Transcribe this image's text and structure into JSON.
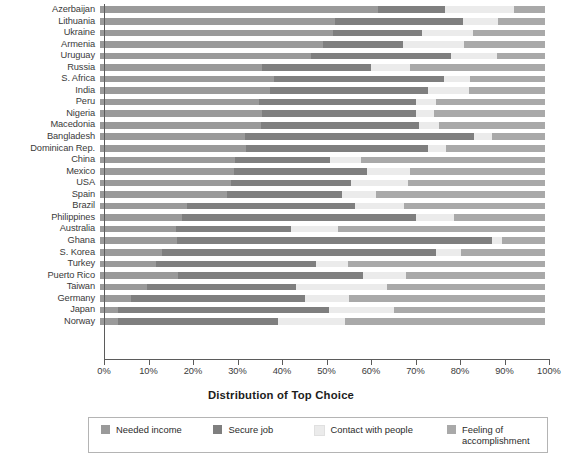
{
  "chart_data": {
    "type": "bar",
    "subtype": "stacked-horizontal-100",
    "title": "",
    "xlabel": "Distribution of Top Choice",
    "ylabel": "",
    "xlim": [
      0,
      100
    ],
    "xticks": [
      "0%",
      "10%",
      "20%",
      "30%",
      "40%",
      "50%",
      "60%",
      "70%",
      "80%",
      "90%",
      "100%"
    ],
    "grid": false,
    "legend_position": "bottom",
    "series": [
      {
        "name": "Needed income",
        "color": "#9a9a9a"
      },
      {
        "name": "Secure job",
        "color": "#7f7f7f"
      },
      {
        "name": "Contact with people",
        "color": "#ebebeb"
      },
      {
        "name": "Feeling of accomplishment",
        "color": "#a9a9a9"
      }
    ],
    "categories": [
      "Azerbaijan",
      "Lithuania",
      "Ukraine",
      "Armenia",
      "Uruguay",
      "Russia",
      "S. Africa",
      "India",
      "Peru",
      "Nigeria",
      "Macedonia",
      "Bangladesh",
      "Dominican Rep.",
      "China",
      "Mexico",
      "USA",
      "Spain",
      "Brazil",
      "Philippines",
      "Australia",
      "Ghana",
      "S. Korea",
      "Turkey",
      "Puerto Rico",
      "Taiwan",
      "Germany",
      "Japan",
      "Norway"
    ],
    "rows": [
      {
        "country": "Azerbaijan",
        "values": [
          62.4,
          15.1,
          15.5,
          7.0
        ]
      },
      {
        "country": "Lithuania",
        "values": [
          52.7,
          28.8,
          8.0,
          10.5
        ]
      },
      {
        "country": "Ukraine",
        "values": [
          52.3,
          20.0,
          11.6,
          16.1
        ]
      },
      {
        "country": "Armenia",
        "values": [
          50.2,
          18.0,
          13.7,
          18.1
        ]
      },
      {
        "country": "Uruguay",
        "values": [
          47.5,
          31.4,
          10.4,
          10.7
        ]
      },
      {
        "country": "Russia",
        "values": [
          36.5,
          24.3,
          8.9,
          30.3
        ]
      },
      {
        "country": "S. Africa",
        "values": [
          39.2,
          38.0,
          6.0,
          16.8
        ]
      },
      {
        "country": "India",
        "values": [
          38.2,
          35.4,
          9.4,
          17.0
        ]
      },
      {
        "country": "Peru",
        "values": [
          35.8,
          35.2,
          4.5,
          24.5
        ]
      },
      {
        "country": "Nigeria",
        "values": [
          36.5,
          34.5,
          4.1,
          24.9
        ]
      },
      {
        "country": "Macedonia",
        "values": [
          36.2,
          35.5,
          4.5,
          23.8
        ]
      },
      {
        "country": "Bangladesh",
        "values": [
          32.5,
          51.5,
          4.2,
          11.8
        ]
      },
      {
        "country": "Dominican Rep.",
        "values": [
          32.9,
          40.7,
          4.1,
          22.3
        ]
      },
      {
        "country": "China",
        "values": [
          30.3,
          21.4,
          7.0,
          41.3
        ]
      },
      {
        "country": "Mexico",
        "values": [
          30.0,
          30.0,
          9.6,
          30.4
        ]
      },
      {
        "country": "USA",
        "values": [
          29.5,
          27.0,
          12.8,
          30.7
        ]
      },
      {
        "country": "Spain",
        "values": [
          28.5,
          25.9,
          7.6,
          38.0
        ]
      },
      {
        "country": "Brazil",
        "values": [
          19.5,
          37.8,
          11.1,
          31.6
        ]
      },
      {
        "country": "Philippines",
        "values": [
          18.5,
          52.5,
          8.5,
          20.5
        ]
      },
      {
        "country": "Australia",
        "values": [
          17.0,
          26.0,
          10.5,
          46.5
        ]
      },
      {
        "country": "Ghana",
        "values": [
          17.2,
          71.0,
          2.1,
          9.7
        ]
      },
      {
        "country": "S. Korea",
        "values": [
          14.0,
          61.5,
          5.7,
          18.8
        ]
      },
      {
        "country": "Turkey",
        "values": [
          12.6,
          36.0,
          7.2,
          44.2
        ]
      },
      {
        "country": "Puerto Rico",
        "values": [
          17.5,
          41.5,
          9.8,
          31.2
        ]
      },
      {
        "country": "Taiwan",
        "values": [
          10.5,
          33.5,
          20.5,
          35.5
        ]
      },
      {
        "country": "Germany",
        "values": [
          7.0,
          39.0,
          10.0,
          44.0
        ]
      },
      {
        "country": "Japan",
        "values": [
          4.0,
          47.5,
          14.5,
          34.0
        ]
      },
      {
        "country": "Norway",
        "values": [
          4.0,
          36.0,
          15.0,
          45.0
        ]
      }
    ]
  },
  "axis": {
    "xlabel": "Distribution of Top Choice",
    "ticks": [
      "0%",
      "10%",
      "20%",
      "30%",
      "40%",
      "50%",
      "60%",
      "70%",
      "80%",
      "90%",
      "100%"
    ]
  },
  "legend": {
    "items": [
      {
        "label": "Needed income",
        "color": "#9a9a9a"
      },
      {
        "label": "Secure job",
        "color": "#7f7f7f"
      },
      {
        "label": "Contact with people",
        "color": "#ebebeb"
      },
      {
        "label": "Feeling of accomplishment",
        "color": "#a9a9a9"
      }
    ]
  }
}
